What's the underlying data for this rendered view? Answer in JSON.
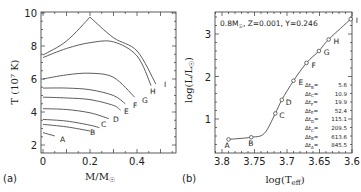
{
  "chart_data": [
    {
      "panel": "(a)",
      "type": "line",
      "xlabel": "M/M☉",
      "ylabel": "T (10⁷ K)",
      "xlim": [
        0,
        0.55
      ],
      "ylim": [
        1.7,
        10
      ],
      "xticks": [
        "0",
        "0.2",
        "0.4"
      ],
      "yticks": [
        "2",
        "4",
        "6",
        "8",
        "10"
      ],
      "series": [
        {
          "name": "A",
          "x": [
            0,
            0.05
          ],
          "y": [
            2.75,
            2.55
          ]
        },
        {
          "name": "B",
          "x": [
            0,
            0.1,
            0.2
          ],
          "y": [
            3.25,
            3.1,
            2.85
          ]
        },
        {
          "name": "C",
          "x": [
            0,
            0.1,
            0.2,
            0.24
          ],
          "y": [
            3.55,
            3.45,
            3.2,
            3.05
          ]
        },
        {
          "name": "D",
          "x": [
            0,
            0.1,
            0.2,
            0.28
          ],
          "y": [
            4.2,
            4.15,
            3.95,
            3.6
          ]
        },
        {
          "name": "E",
          "x": [
            0,
            0.1,
            0.2,
            0.3,
            0.33
          ],
          "y": [
            4.9,
            4.85,
            4.75,
            4.4,
            4.1
          ]
        },
        {
          "name": "F",
          "x": [
            0,
            0.1,
            0.2,
            0.3,
            0.35
          ],
          "y": [
            5.45,
            5.45,
            5.35,
            5.0,
            4.5
          ]
        },
        {
          "name": "G",
          "x": [
            0,
            0.1,
            0.2,
            0.3,
            0.39
          ],
          "y": [
            6.0,
            6.25,
            6.35,
            6.1,
            4.9
          ]
        },
        {
          "name": "H",
          "x": [
            0,
            0.1,
            0.2,
            0.3,
            0.4,
            0.46
          ],
          "y": [
            7.3,
            7.85,
            8.2,
            8.25,
            7.4,
            5.6
          ]
        },
        {
          "name": "I",
          "x": [
            0,
            0.1,
            0.2,
            0.3,
            0.4,
            0.48
          ],
          "y": [
            7.45,
            8.3,
            9.75,
            8.5,
            7.7,
            5.7
          ]
        }
      ],
      "annotations": [
        "A",
        "B",
        "C",
        "D",
        "E",
        "F",
        "G",
        "H",
        "I"
      ]
    },
    {
      "panel": "(b)",
      "type": "line",
      "title": "0.8M☉, Z=0.001, Y=0.246",
      "xlabel": "log(Teff)",
      "ylabel": "log(L/L☉)",
      "xlim": [
        3.81,
        3.59
      ],
      "ylim": [
        0.25,
        3.55
      ],
      "xticks": [
        "3.8",
        "3.75",
        "3.7",
        "3.65",
        "3.6"
      ],
      "yticks": [
        "1",
        "2",
        "3"
      ],
      "points": [
        {
          "label": "A",
          "x": 3.79,
          "y": 0.52
        },
        {
          "label": "B",
          "x": 3.755,
          "y": 0.57
        },
        {
          "label": "C",
          "x": 3.718,
          "y": 1.13
        },
        {
          "label": "D",
          "x": 3.708,
          "y": 1.45
        },
        {
          "label": "E",
          "x": 3.69,
          "y": 1.9
        },
        {
          "label": "F",
          "x": 3.67,
          "y": 2.32
        },
        {
          "label": "G",
          "x": 3.651,
          "y": 2.6
        },
        {
          "label": "H",
          "x": 3.636,
          "y": 2.87
        },
        {
          "label": "I",
          "x": 3.602,
          "y": 3.35
        }
      ],
      "legend_text": [
        {
          "label": "Δt_B",
          "value": "5.6"
        },
        {
          "label": "Δt_C",
          "value": "10.9"
        },
        {
          "label": "Δt_F",
          "value": "19.9"
        },
        {
          "label": "Δt_E",
          "value": "52.4"
        },
        {
          "label": "Δt_D",
          "value": "115.1"
        },
        {
          "label": "Δt_C",
          "value": "209.5"
        },
        {
          "label": "Δt_B",
          "value": "613.6"
        },
        {
          "label": "Δt_A",
          "value": "845.5"
        }
      ]
    }
  ],
  "labels": {
    "panel_a": "(a)",
    "panel_b": "(b)",
    "a_xlabel": "M/M",
    "a_ylabel": "T (10⁷ K)",
    "b_xlabel": "log(T",
    "b_xlabel_sub": "eff",
    "b_ylabel": "log(L/L",
    "b_title": "0.8M",
    "b_title_rest": ", Z=0.001, Y=0.246"
  }
}
